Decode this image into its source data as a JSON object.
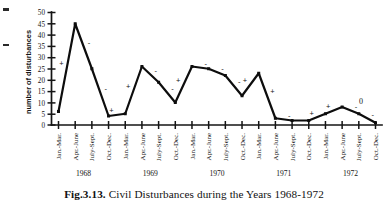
{
  "figure": {
    "caption_number": "Fig.3.13.",
    "caption_text": "Civil Disturbances during the Years 1968-1972"
  },
  "chart_data": {
    "type": "line",
    "title": "",
    "xlabel": "",
    "ylabel": "number of disturbances",
    "ylim": [
      0,
      50
    ],
    "ytick_step": 5,
    "yticks": [
      "0",
      "5",
      "10",
      "15",
      "20",
      "25",
      "30",
      "35",
      "40",
      "45",
      "50"
    ],
    "grid": false,
    "legend": "none",
    "years": [
      "1968",
      "1969",
      "1970",
      "1971",
      "1972"
    ],
    "quarters": [
      "Jan.-Mar.",
      "Apr.-June",
      "July-Sept.",
      "Oct.-Dec."
    ],
    "categories": [
      "Jan.-Mar.",
      "Apr.-June",
      "July-Sept.",
      "Oct.-Dec.",
      "Jan.-Mar.",
      "Apr.-June",
      "July-Sept.",
      "Oct.-Dec.",
      "Jan.-Mar.",
      "Apr.-June",
      "July-Sept.",
      "Oct.-Dec.",
      "Jan.-Mar.",
      "Apr.-June",
      "July-Sept.",
      "Oct.-Dec.",
      "Jan.-Mar.",
      "Apr.-June",
      "July-Sept.",
      "Oct.-Dec."
    ],
    "values": [
      6,
      45,
      25,
      4,
      5,
      26,
      19,
      10,
      26,
      25,
      22,
      13,
      23,
      3,
      2,
      2,
      5,
      8,
      5,
      1
    ],
    "segment_signs": [
      "+",
      "-",
      "-",
      "+",
      "+",
      "-",
      "-",
      "+",
      "-",
      "-",
      "-",
      "+",
      "+",
      "-",
      "",
      "+",
      "+",
      "-",
      "-"
    ],
    "annotations": [
      {
        "label": "0",
        "near_category": "July-Sept.",
        "near_year": "1972"
      }
    ]
  }
}
